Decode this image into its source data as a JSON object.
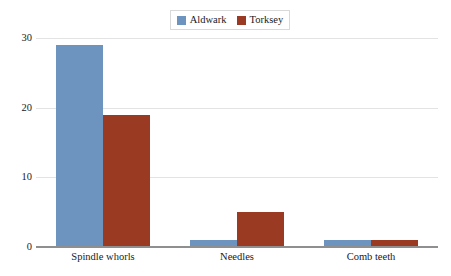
{
  "chart_data": {
    "type": "bar",
    "title": "",
    "xlabel": "",
    "ylabel": "",
    "categories": [
      "Spindle whorls",
      "Needles",
      "Comb teeth"
    ],
    "series": [
      {
        "name": "Aldwark",
        "color": "#6d93bf",
        "values": [
          29,
          1,
          1
        ]
      },
      {
        "name": "Torksey",
        "color": "#9b3a22",
        "values": [
          19,
          5,
          1
        ]
      }
    ],
    "ylim": [
      0,
      30
    ],
    "yticks": [
      0,
      10,
      20,
      30
    ],
    "ytick_labels": [
      "0",
      "10",
      "20",
      "30"
    ],
    "grid": true,
    "legend_position": "top-center"
  },
  "legend": {
    "entries": [
      {
        "label": "Aldwark",
        "color": "#6d93bf"
      },
      {
        "label": "Torksey",
        "color": "#9b3a22"
      }
    ]
  },
  "colors": {
    "series_1": "#6d93bf",
    "series_2": "#9b3a22",
    "gridline": "#e3e3e3",
    "axis": "#8f8f8f",
    "text": "#1a1a1a",
    "legend_border": "#d9d9d9",
    "background": "#ffffff"
  }
}
